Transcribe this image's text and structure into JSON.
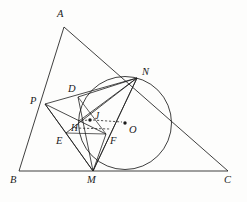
{
  "figure": {
    "type": "geometric-diagram",
    "width": 247,
    "height": 202,
    "background_color": "#fdfdfc",
    "stroke_color": "#1d1d1d",
    "dash_color": "#2a2a2a",
    "label_color": "#1b1b1b"
  },
  "labels": {
    "A": "A",
    "B": "B",
    "C": "C",
    "D": "D",
    "E": "E",
    "F": "F",
    "H": "H",
    "J": "J",
    "M": "M",
    "N": "N",
    "O": "O",
    "P": "P"
  },
  "points": {
    "A": {
      "x": 64,
      "y": 27,
      "label_x": 57,
      "label_y": 10,
      "dot": false
    },
    "B": {
      "x": 19,
      "y": 171,
      "label_x": 11,
      "label_y": 180,
      "dot": false
    },
    "C": {
      "x": 228,
      "y": 171,
      "label_x": 225,
      "label_y": 180,
      "dot": false
    },
    "P": {
      "x": 45,
      "y": 104,
      "label_x": 31,
      "label_y": 98,
      "dot": false
    },
    "N": {
      "x": 137,
      "y": 78,
      "label_x": 143,
      "label_y": 70,
      "dot": false
    },
    "M": {
      "x": 93,
      "y": 171,
      "label_x": 88,
      "label_y": 180,
      "dot": false
    },
    "D": {
      "x": 78,
      "y": 97,
      "label_x": 70,
      "label_y": 85,
      "dot": false
    },
    "E": {
      "x": 66,
      "y": 133,
      "label_x": 58,
      "label_y": 140,
      "dot": false
    },
    "F": {
      "x": 106,
      "y": 134,
      "label_x": 109,
      "label_y": 143,
      "dot": false
    },
    "H": {
      "x": 79,
      "y": 121,
      "label_x": 73,
      "label_y": 130,
      "dot": false
    },
    "J": {
      "x": 90,
      "y": 120,
      "label_x": 95,
      "label_y": 117,
      "dot": true
    },
    "O": {
      "x": 125,
      "y": 123,
      "label_x": 130,
      "label_y": 131,
      "dot": true
    }
  },
  "circle": {
    "center_x": 125,
    "center_y": 123,
    "radius": 46.5,
    "name": "circumcircle-MNP"
  },
  "segments": [
    {
      "name": "side-AB",
      "from": "A",
      "to": "B",
      "style": "solid"
    },
    {
      "name": "side-AC",
      "from": "A",
      "to": "C",
      "style": "solid"
    },
    {
      "name": "side-BC",
      "from": "B",
      "to": "C",
      "style": "solid"
    },
    {
      "name": "chord-PN",
      "from": "P",
      "to": "N",
      "style": "solid"
    },
    {
      "name": "chord-PM",
      "from": "P",
      "to": "M",
      "style": "solid"
    },
    {
      "name": "chord-NM",
      "from": "N",
      "to": "M",
      "style": "solid"
    },
    {
      "name": "cevian-PF",
      "from": "P",
      "to": "F",
      "style": "solid"
    },
    {
      "name": "cevian-ND",
      "from": "N",
      "to": "D",
      "style": "solid"
    },
    {
      "name": "cevian-NE",
      "from": "N",
      "to": "E",
      "style": "solid"
    },
    {
      "name": "cevian-MD",
      "from": "M",
      "to": "D",
      "style": "solid"
    },
    {
      "name": "cevian-ME",
      "from": "M",
      "to": "E",
      "style": "solid"
    },
    {
      "name": "cevian-MF",
      "from": "M",
      "to": "F",
      "style": "solid"
    },
    {
      "name": "segment-PH-extended",
      "from": "P",
      "to": "F",
      "style": "solid"
    },
    {
      "name": "segment-EF",
      "from": "E",
      "to": "F",
      "style": "solid"
    },
    {
      "name": "segment-DF",
      "from": "D",
      "to": "F",
      "style": "solid"
    }
  ],
  "dashed_segments": [
    {
      "name": "dashed-H-to-J",
      "x1": 82,
      "y1": 121,
      "x2": 88,
      "y2": 120
    },
    {
      "name": "dashed-J-to-O",
      "x1": 93,
      "y1": 120,
      "x2": 122,
      "y2": 122
    },
    {
      "name": "dashed-H-to-F",
      "x1": 76,
      "y1": 128,
      "x2": 110,
      "y2": 129
    }
  ],
  "dots": [
    {
      "name": "dot-J",
      "x": 90,
      "y": 120,
      "r": 1.7
    },
    {
      "name": "dot-O",
      "x": 125,
      "y": 123,
      "r": 1.7
    }
  ],
  "caption": ""
}
